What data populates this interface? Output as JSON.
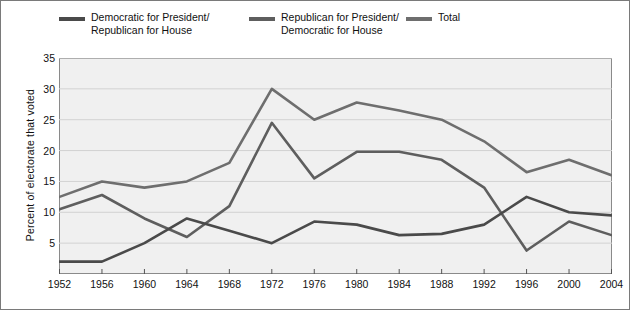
{
  "legend": {
    "items": [
      {
        "key": "democratic",
        "label": "Democratic for President/\nRepublican for House",
        "color": "#4a4a4a",
        "swatch_name": "legend-swatch-democratic"
      },
      {
        "key": "republican",
        "label": "Republican for President/\nDemocratic for House",
        "color": "#5e5e5e",
        "swatch_name": "legend-swatch-republican"
      },
      {
        "key": "total",
        "label": "Total",
        "color": "#6e6e6e",
        "swatch_name": "legend-swatch-total"
      }
    ]
  },
  "axes": {
    "ylabel": "Percent of electorate that voted",
    "yticks": [
      "5",
      "10",
      "15",
      "20",
      "25",
      "30",
      "35"
    ],
    "xticks": [
      "1952",
      "1956",
      "1960",
      "1964",
      "1968",
      "1972",
      "1976",
      "1980",
      "1984",
      "1988",
      "1992",
      "1996",
      "2000",
      "2004"
    ]
  },
  "chart_data": {
    "type": "line",
    "title": "",
    "xlabel": "",
    "ylabel": "Percent of electorate that voted",
    "x": [
      1952,
      1956,
      1960,
      1964,
      1968,
      1972,
      1976,
      1980,
      1984,
      1988,
      1992,
      1996,
      2000,
      2004
    ],
    "categories": [
      "1952",
      "1956",
      "1960",
      "1964",
      "1968",
      "1972",
      "1976",
      "1980",
      "1984",
      "1988",
      "1992",
      "1996",
      "2000",
      "2004"
    ],
    "xlim": [
      1952,
      2004
    ],
    "ylim": [
      0,
      35
    ],
    "ytick_values": [
      5,
      10,
      15,
      20,
      25,
      30,
      35
    ],
    "grid": true,
    "legend_position": "above-plot",
    "series": [
      {
        "name": "Democratic for President/Republican for House",
        "color": "#4a4a4a",
        "values": [
          2.0,
          2.0,
          5.0,
          9.0,
          7.0,
          5.0,
          8.5,
          8.0,
          6.3,
          6.5,
          8.0,
          12.5,
          10.0,
          9.5
        ]
      },
      {
        "name": "Republican for President/Democratic for House",
        "color": "#5e5e5e",
        "values": [
          10.5,
          12.8,
          9.0,
          6.0,
          11.0,
          24.5,
          15.5,
          19.8,
          19.8,
          18.5,
          14.0,
          3.8,
          8.5,
          6.3
        ]
      },
      {
        "name": "Total",
        "color": "#6e6e6e",
        "values": [
          12.5,
          15.0,
          14.0,
          15.0,
          18.0,
          30.0,
          25.0,
          27.8,
          26.5,
          25.0,
          21.5,
          16.5,
          18.5,
          16.0
        ]
      }
    ]
  }
}
